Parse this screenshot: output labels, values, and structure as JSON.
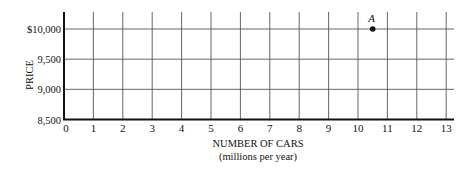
{
  "chart_data": {
    "type": "scatter",
    "title": "",
    "xlabel": "NUMBER OF CARS",
    "xlabel_sub": "(millions per year)",
    "ylabel": "PRICE",
    "xlim": [
      0,
      13
    ],
    "ylim": [
      8500,
      10000
    ],
    "x_ticks": [
      0,
      1,
      2,
      3,
      4,
      5,
      6,
      7,
      8,
      9,
      10,
      11,
      12,
      13
    ],
    "y_ticks": [
      8500,
      9000,
      9500,
      10000
    ],
    "y_tick_labels": [
      "8,500",
      "9,000",
      "9,500",
      "$10,000"
    ],
    "grid": true,
    "points": [
      {
        "label": "A",
        "x": 10.5,
        "y": 10000
      }
    ]
  }
}
